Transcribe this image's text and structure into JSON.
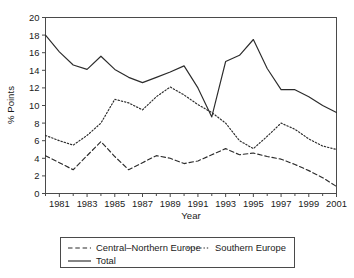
{
  "chart_data": {
    "type": "line",
    "title": "",
    "xlabel": "Year",
    "ylabel": "% Points",
    "xlim": [
      1980,
      2001
    ],
    "ylim": [
      0,
      20
    ],
    "ytick_step": 2,
    "yticks": [
      "0",
      "2",
      "4",
      "6",
      "8",
      "10",
      "12",
      "14",
      "16",
      "18",
      "20"
    ],
    "xticks": [
      "1981",
      "1983",
      "1985",
      "1987",
      "1989",
      "1991",
      "1993",
      "1995",
      "1997",
      "1999",
      "2001"
    ],
    "xtick_values": [
      1981,
      1983,
      1985,
      1987,
      1989,
      1991,
      1993,
      1995,
      1997,
      1999,
      2001
    ],
    "xminor_values": [
      1980,
      1982,
      1984,
      1986,
      1988,
      1990,
      1992,
      1994,
      1996,
      1998,
      2000
    ],
    "grid": false,
    "legend_position": "below",
    "x": [
      1980,
      1981,
      1982,
      1983,
      1984,
      1985,
      1986,
      1987,
      1988,
      1989,
      1990,
      1991,
      1992,
      1993,
      1994,
      1995,
      1996,
      1997,
      1998,
      1999,
      2000,
      2001
    ],
    "series": [
      {
        "name": "Central-Northern Europe",
        "style": "dashed",
        "color": "#2b2b2b",
        "values": [
          4.3,
          3.5,
          2.7,
          4.3,
          5.9,
          4.2,
          2.7,
          3.5,
          4.3,
          4.0,
          3.4,
          3.7,
          4.4,
          5.1,
          4.4,
          4.6,
          4.2,
          3.9,
          3.3,
          2.6,
          1.8,
          0.8
        ]
      },
      {
        "name": "Southern Europe",
        "style": "dotted",
        "color": "#2b2b2b",
        "values": [
          6.6,
          6.0,
          5.5,
          6.6,
          8.0,
          10.7,
          10.3,
          9.5,
          11.0,
          12.1,
          11.2,
          10.1,
          9.2,
          8.0,
          6.0,
          5.1,
          6.5,
          8.0,
          7.3,
          6.2,
          5.4,
          5.0
        ]
      },
      {
        "name": "Total",
        "style": "solid",
        "color": "#2b2b2b",
        "values": [
          18.0,
          16.1,
          14.6,
          14.1,
          15.6,
          14.1,
          13.2,
          12.6,
          13.2,
          13.8,
          14.5,
          12.0,
          8.7,
          15.0,
          15.7,
          17.5,
          14.2,
          11.8,
          11.8,
          11.0,
          10.0,
          9.2
        ]
      }
    ],
    "legend": [
      {
        "label": "Central–Northern Europe",
        "style": "dashed"
      },
      {
        "label": "Southern Europe",
        "style": "dotted"
      },
      {
        "label": "Total",
        "style": "solid"
      }
    ]
  }
}
